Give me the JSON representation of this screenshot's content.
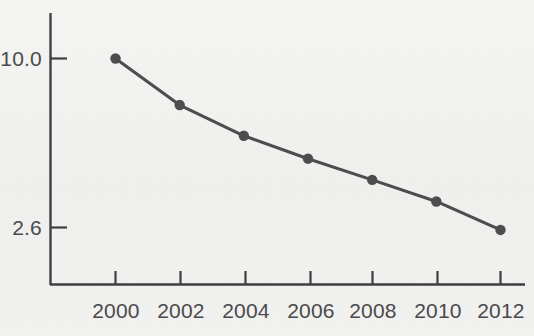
{
  "chart_data": {
    "type": "line",
    "title": "",
    "subtitle": "",
    "xlabel": "",
    "ylabel": "",
    "x": [
      2000,
      2002,
      2004,
      2006,
      2008,
      2010,
      2012
    ],
    "categories": [
      "2000",
      "2002",
      "2004",
      "2006",
      "2008",
      "2010",
      "2012"
    ],
    "values": [
      10.0,
      6.9,
      5.4,
      4.5,
      3.8,
      3.2,
      2.55
    ],
    "series": [
      {
        "name": "series-1",
        "values": [
          10.0,
          6.9,
          5.4,
          4.5,
          3.8,
          3.2,
          2.55
        ]
      }
    ],
    "xtick_labels": [
      "2000",
      "2002",
      "2004",
      "2006",
      "2008",
      "2010",
      "2012"
    ],
    "ytick_labels": [
      "10.0",
      "2.6"
    ],
    "ytick_values": [
      10.0,
      2.6
    ],
    "xlim": [
      1999,
      2013
    ],
    "ylim": [
      2.2,
      11.2
    ],
    "yscale": "log",
    "grid": false,
    "legend": false,
    "legend_position": "none",
    "marker": "circle",
    "line_color": "#4d4d4d",
    "marker_color": "#4d4d4d",
    "axis_color": "#3f3f3f",
    "background_color": "#f1f1ef",
    "annotations": []
  },
  "axes": {
    "y_ticks": [
      {
        "label": "10.0",
        "value": 10.0
      },
      {
        "label": "2.6",
        "value": 2.6
      }
    ],
    "x_ticks": [
      {
        "label": "2000",
        "value": 2000
      },
      {
        "label": "2002",
        "value": 2002
      },
      {
        "label": "2004",
        "value": 2004
      },
      {
        "label": "2006",
        "value": 2006
      },
      {
        "label": "2008",
        "value": 2008
      },
      {
        "label": "2010",
        "value": 2010
      },
      {
        "label": "2012",
        "value": 2012
      }
    ]
  }
}
